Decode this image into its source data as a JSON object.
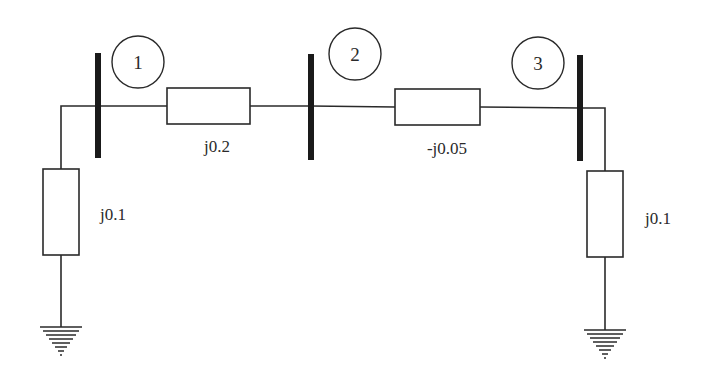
{
  "diagram": {
    "type": "power-system-one-line",
    "colors": {
      "line": "#2a2a2a",
      "bus": "#1a1a1a",
      "background": "#ffffff"
    },
    "buses": [
      {
        "id": "1",
        "label": "1"
      },
      {
        "id": "2",
        "label": "2"
      },
      {
        "id": "3",
        "label": "3"
      }
    ],
    "series_branches": [
      {
        "from": "1",
        "to": "2",
        "impedance": "j0.2"
      },
      {
        "from": "2",
        "to": "3",
        "impedance": "-j0.05"
      }
    ],
    "shunt_branches": [
      {
        "bus": "1",
        "impedance": "j0.1",
        "to": "ground"
      },
      {
        "bus": "3",
        "impedance": "j0.1",
        "to": "ground"
      }
    ]
  }
}
